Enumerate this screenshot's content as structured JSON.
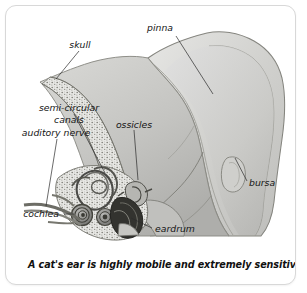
{
  "figure": {
    "caption": "A cat's ear is highly mobile and extremely sensitive",
    "style": "grayscale pencil illustration",
    "card": {
      "background_color": "#ffffff",
      "border_color": "#d8d8d8",
      "corner_radius_px": 11
    }
  },
  "labels": {
    "pinna": "pinna",
    "skull": "skull",
    "semicircular_line1": "semi-circular",
    "semicircular_line2": "canals",
    "auditory_nerve": "auditory nerve",
    "cochlea": "cochlea",
    "ossicles": "ossicles",
    "eardrum": "eardrum",
    "bursa": "bursa"
  },
  "palette": {
    "ink": "#151515",
    "leader": "#2b2b2b",
    "pinna_fill": "#d4d4d2",
    "pinna_inner_fill": "#c9c9c6",
    "pinna_outline": "#8d8d8a",
    "head_fill": "#c2c2bf",
    "bone_fill": "#e2e2df",
    "bone_speckle": "#6e6e6b",
    "inner_ear_dark": "#3a3a38",
    "inner_ear_mid": "#7e7e7b",
    "eardrum_dark": "#2a2a28"
  }
}
